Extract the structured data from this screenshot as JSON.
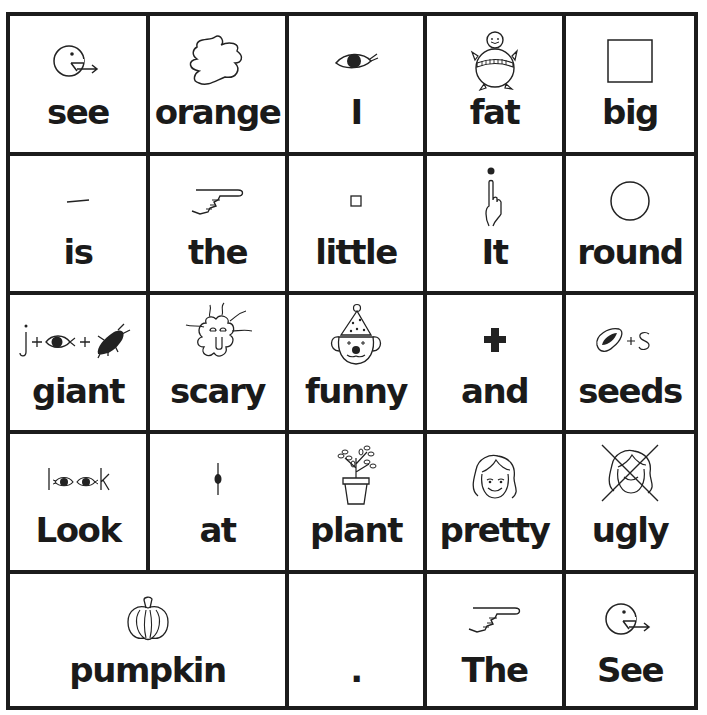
{
  "board": {
    "rows": [
      [
        {
          "word": "see",
          "symbol": "see-icon"
        },
        {
          "word": "orange",
          "symbol": "orange-blob-icon"
        },
        {
          "word": "I",
          "symbol": "eye-icon"
        },
        {
          "word": "fat",
          "symbol": "fat-person-icon"
        },
        {
          "word": "big",
          "symbol": "big-square-icon"
        }
      ],
      [
        {
          "word": "is",
          "symbol": "dash-icon"
        },
        {
          "word": "the",
          "symbol": "pointing-hand-icon"
        },
        {
          "word": "little",
          "symbol": "small-square-icon"
        },
        {
          "word": "It",
          "symbol": "finger-point-up-icon"
        },
        {
          "word": "round",
          "symbol": "circle-icon"
        }
      ],
      [
        {
          "word": "giant",
          "symbol": "j-eye-bug-icon",
          "symbol_text": "j+ +"
        },
        {
          "word": "scary",
          "symbol": "scary-face-icon"
        },
        {
          "word": "funny",
          "symbol": "clown-icon"
        },
        {
          "word": "and",
          "symbol": "plus-icon"
        },
        {
          "word": "seeds",
          "symbol": "seed-plus-s-icon",
          "symbol_text": "+S"
        }
      ],
      [
        {
          "word": "Look",
          "symbol": "look-eyes-icon",
          "symbol_text": "l  k"
        },
        {
          "word": "at",
          "symbol": "at-line-dot-icon"
        },
        {
          "word": "plant",
          "symbol": "potted-plant-icon"
        },
        {
          "word": "pretty",
          "symbol": "pretty-face-icon"
        },
        {
          "word": "ugly",
          "symbol": "crossed-face-icon"
        }
      ],
      [
        {
          "word": "pumpkin",
          "symbol": "pumpkin-icon",
          "span": 2
        },
        {
          "word": ".",
          "symbol": "none"
        },
        {
          "word": "The",
          "symbol": "pointing-hand-icon"
        },
        {
          "word": "See",
          "symbol": "see-icon"
        }
      ]
    ]
  }
}
